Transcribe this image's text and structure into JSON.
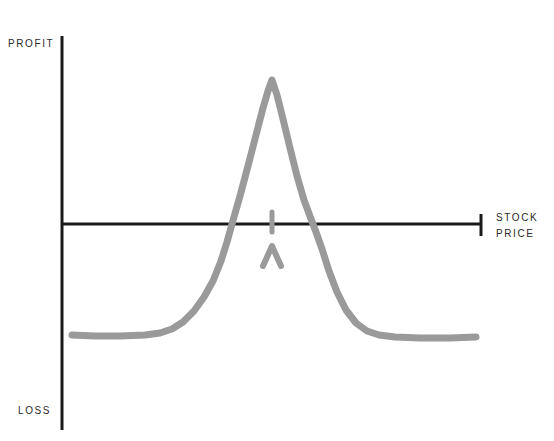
{
  "chart": {
    "title": "",
    "axis_labels": {
      "y_top": "PROFIT",
      "y_bottom": "LOSS",
      "x_end_line1": "STOCK",
      "x_end_line2": "PRICE"
    },
    "colors": {
      "axis": "#1a1a1a",
      "curve": "#9a9a9a",
      "annotation": "#9a9a9a",
      "background": "#ffffff",
      "label_text": "#2b2b2b"
    },
    "geometry": {
      "y_axis_x": 62,
      "y_axis_top": 36,
      "y_axis_bottom": 430,
      "x_axis_y": 224,
      "x_axis_left": 62,
      "x_axis_right": 482,
      "x_axis_end_tick_top": 214,
      "x_axis_end_tick_bottom": 236,
      "curve_stroke_width": 7,
      "axis_stroke_width": 3
    }
  },
  "chart_data": {
    "type": "line",
    "title": "",
    "xlabel": "STOCK PRICE",
    "ylabel": "PROFIT / LOSS",
    "grid": false,
    "legend": null,
    "axis_origin_label": "0",
    "xlim": [
      62,
      482
    ],
    "ylim_pixels": [
      36,
      430
    ],
    "zero_line_y": 224,
    "series": [
      {
        "name": "Payoff",
        "color": "#9a9a9a",
        "points": [
          [
            72,
            335
          ],
          [
            95,
            336
          ],
          [
            120,
            336
          ],
          [
            145,
            335
          ],
          [
            160,
            333
          ],
          [
            172,
            329
          ],
          [
            183,
            322
          ],
          [
            194,
            311
          ],
          [
            204,
            297
          ],
          [
            213,
            281
          ],
          [
            221,
            261
          ],
          [
            227,
            242
          ],
          [
            232,
            224
          ],
          [
            240,
            196
          ],
          [
            248,
            166
          ],
          [
            256,
            135
          ],
          [
            263,
            108
          ],
          [
            268,
            91
          ],
          [
            272,
            80
          ],
          [
            277,
            95
          ],
          [
            283,
            119
          ],
          [
            290,
            148
          ],
          [
            297,
            176
          ],
          [
            304,
            200
          ],
          [
            311,
            219
          ],
          [
            316,
            232
          ],
          [
            322,
            249
          ],
          [
            329,
            271
          ],
          [
            337,
            292
          ],
          [
            346,
            310
          ],
          [
            356,
            323
          ],
          [
            367,
            331
          ],
          [
            379,
            335
          ],
          [
            395,
            337
          ],
          [
            420,
            338
          ],
          [
            450,
            338
          ],
          [
            476,
            337
          ]
        ]
      }
    ],
    "key_points": {
      "peak": {
        "x": 272,
        "y": 80,
        "meaning": "maximum profit at strike"
      },
      "breakeven_left": {
        "x": 231,
        "y": 224,
        "meaning": "lower break-even"
      },
      "breakeven_right": {
        "x": 317,
        "y": 224,
        "meaning": "upper break-even"
      },
      "max_loss_level_y": 336,
      "tail_left_start_x": 72,
      "tail_right_end_x": 476
    },
    "annotations": [
      {
        "name": "strike-tick",
        "type": "vertical-tick",
        "x": 272,
        "y_top": 212,
        "y_bottom": 232,
        "color": "#9a9a9a"
      },
      {
        "name": "strike-caret",
        "type": "caret-up",
        "x": 272,
        "y_top": 246,
        "y_bottom": 266,
        "half_width": 9,
        "color": "#9a9a9a"
      }
    ]
  }
}
